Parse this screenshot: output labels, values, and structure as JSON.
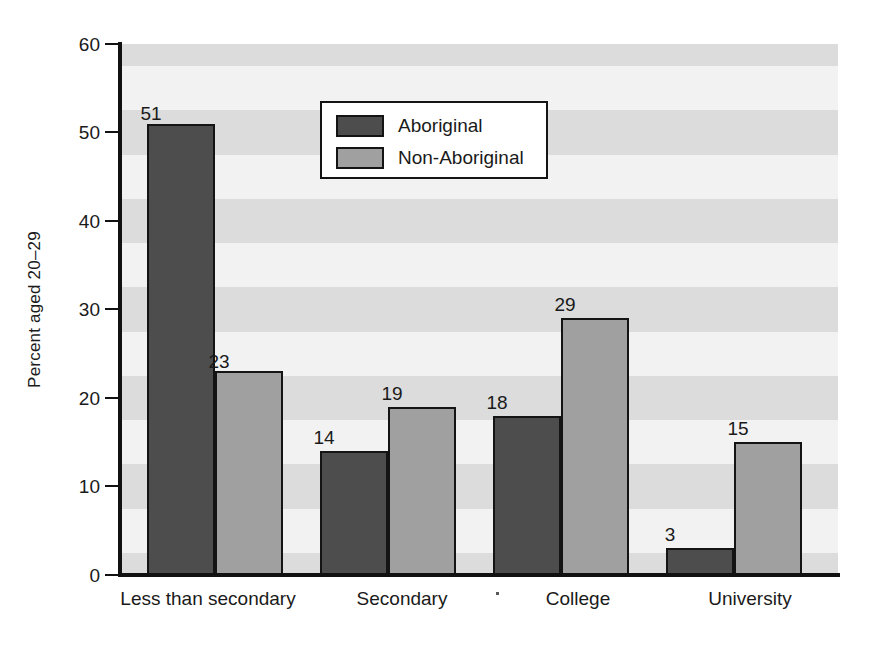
{
  "chart_data": {
    "type": "bar",
    "title": "",
    "xlabel": "",
    "ylabel": "Percent aged 20–29",
    "categories": [
      "Less than secondary",
      "Secondary",
      "College",
      "University"
    ],
    "series": [
      {
        "name": "Aboriginal",
        "color": "#4d4d4d",
        "values": [
          51,
          14,
          18,
          3
        ]
      },
      {
        "name": "Non-Aboriginal",
        "color": "#a0a0a0",
        "values": [
          23,
          19,
          29,
          15
        ]
      }
    ],
    "ylim": [
      0,
      60
    ],
    "yticks": [
      0,
      10,
      20,
      30,
      40,
      50,
      60
    ],
    "ytick_labels": [
      "0",
      "10",
      "20",
      "30",
      "40",
      "50",
      "60"
    ],
    "data_labels": [
      [
        "51",
        "23"
      ],
      [
        "14",
        "19"
      ],
      [
        "18",
        "29"
      ],
      [
        "3",
        "15"
      ]
    ],
    "grid": false,
    "background_banding": true,
    "legend_position": "upper-center",
    "legend_entries": [
      "Aboriginal",
      "Non-Aboriginal"
    ]
  },
  "axis": {
    "y_title": "Percent aged 20–29",
    "y_tick_labels": [
      "60",
      "50",
      "40",
      "30",
      "20",
      "10",
      "0"
    ],
    "x_tick_labels": [
      "Less than secondary",
      "Secondary",
      "College",
      "University"
    ]
  },
  "legend": {
    "items": [
      {
        "label": "Aboriginal",
        "swatch": "dark-gray-swatch"
      },
      {
        "label": "Non-Aboriginal",
        "swatch": "light-gray-swatch"
      }
    ]
  },
  "colors": {
    "series_aboriginal": "#4d4d4d",
    "series_non_aboriginal": "#a0a0a0",
    "axis": "#141414",
    "plot_band_light": "#f2f2f2",
    "plot_band_dark": "#dcdcdc"
  }
}
